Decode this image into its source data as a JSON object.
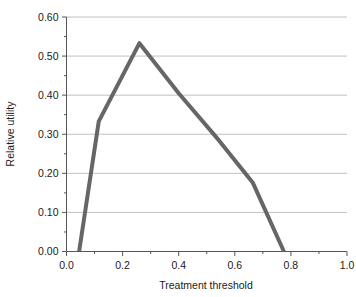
{
  "chart_data": {
    "type": "line",
    "title": "",
    "subtitle": "",
    "xlabel": "Treatment threshold",
    "ylabel": "Relative utility",
    "xlim": [
      0.0,
      1.0
    ],
    "ylim": [
      0.0,
      0.6
    ],
    "xticks": [
      "0.0",
      "0.2",
      "0.4",
      "0.6",
      "0.8",
      "1.0"
    ],
    "xtick_values": [
      0.0,
      0.2,
      0.4,
      0.6,
      0.8,
      1.0
    ],
    "yticks": [
      "0.00",
      "0.10",
      "0.20",
      "0.30",
      "0.40",
      "0.50",
      "0.60"
    ],
    "ytick_values": [
      0.0,
      0.1,
      0.2,
      0.3,
      0.4,
      0.5,
      0.6
    ],
    "x_minor_step": 0.1,
    "y_minor_step": 0.05,
    "grid": "horizontal",
    "grid_color": "#b0b0b0",
    "legend": "none",
    "line_color": "#666666",
    "line_width": 4,
    "series": [
      {
        "name": "Relative utility",
        "x": [
          0.045,
          0.115,
          0.26,
          0.4,
          0.545,
          0.665,
          0.775
        ],
        "values": [
          0.0,
          0.333,
          0.533,
          0.405,
          0.283,
          0.175,
          0.0
        ]
      }
    ],
    "annotations": []
  },
  "axis": {
    "x_title": "Treatment threshold",
    "y_title": "Relative utility"
  }
}
